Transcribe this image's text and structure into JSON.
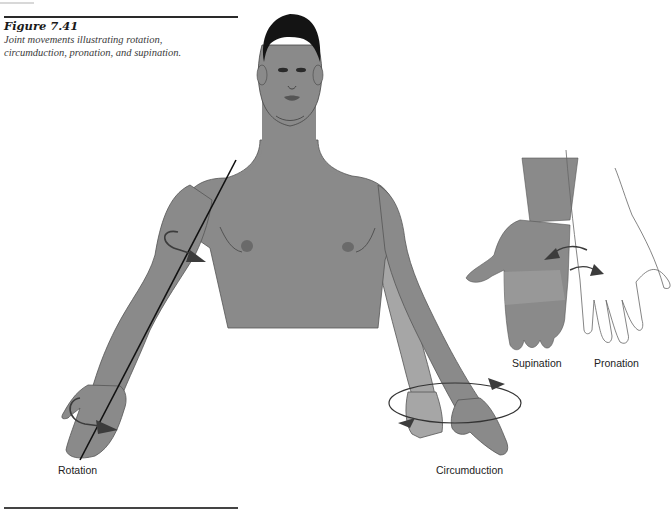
{
  "figure": {
    "number": "Figure 7.41",
    "caption_line1": "Joint movements illustrating rotation,",
    "caption_line2": "circumduction, pronation, and supination."
  },
  "labels": {
    "rotation": "Rotation",
    "circumduction": "Circumduction",
    "supination": "Supination",
    "pronation": "Pronation"
  },
  "colors": {
    "skin": "#8a8a8a",
    "skin_light": "#a9a9a9",
    "hair": "#141414",
    "outline": "#3a3a3a",
    "arrow": "#3c3c3c",
    "background": "#ffffff"
  }
}
